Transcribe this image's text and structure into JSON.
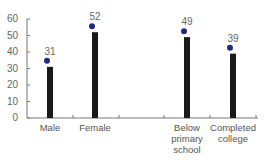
{
  "chart_data": {
    "type": "bar",
    "title": "",
    "xlabel": "",
    "ylabel": "",
    "ylim": [
      0,
      60
    ],
    "yticks": [
      0,
      10,
      20,
      30,
      40,
      50,
      60
    ],
    "categories": [
      "Male",
      "Female",
      "Below\nprimary\nschool",
      "Completed\ncollege"
    ],
    "values": [
      31,
      52,
      49,
      39
    ],
    "value_labels": [
      "31",
      "52",
      "49",
      "39"
    ],
    "markers": "dot above each bar",
    "grid": false,
    "legend": null,
    "colors": {
      "bar": "#1a1a1a",
      "dot": "#1e2a7a",
      "axis": "#777777",
      "text": "#555555"
    }
  }
}
